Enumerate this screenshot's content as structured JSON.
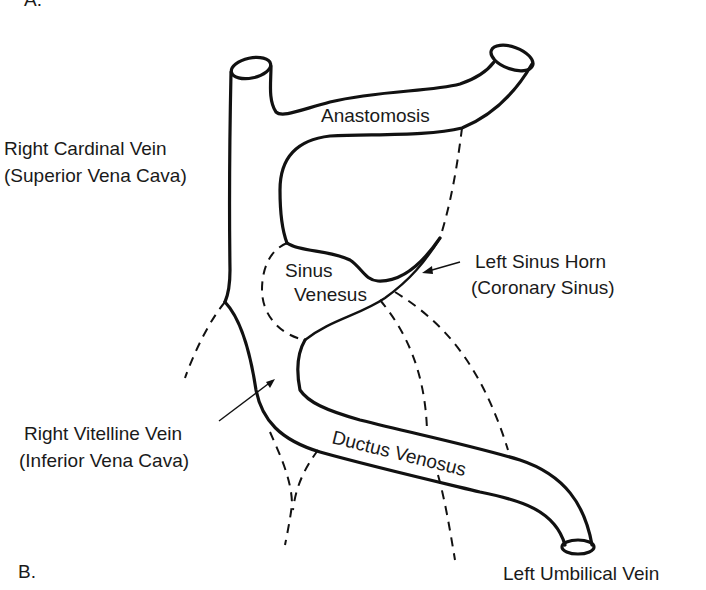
{
  "figure": {
    "panel_top_label": "A.",
    "panel_label": "B."
  },
  "labels": {
    "anastomosis": "Anastomosis",
    "right_cardinal_line1": "Right Cardinal Vein",
    "right_cardinal_line2": "(Superior Vena Cava)",
    "sinus_line1": "Sinus",
    "sinus_line2": "Venesus",
    "left_sinus_horn_line1": "Left Sinus Horn",
    "left_sinus_horn_line2": "(Coronary Sinus)",
    "right_vitelline_line1": "Right Vitelline Vein",
    "right_vitelline_line2": "(Inferior Vena Cava)",
    "ductus_venosus": "Ductus Venosus",
    "left_umbilical": "Left Umbilical Vein"
  },
  "colors": {
    "line": "#111111",
    "background": "#ffffff"
  }
}
